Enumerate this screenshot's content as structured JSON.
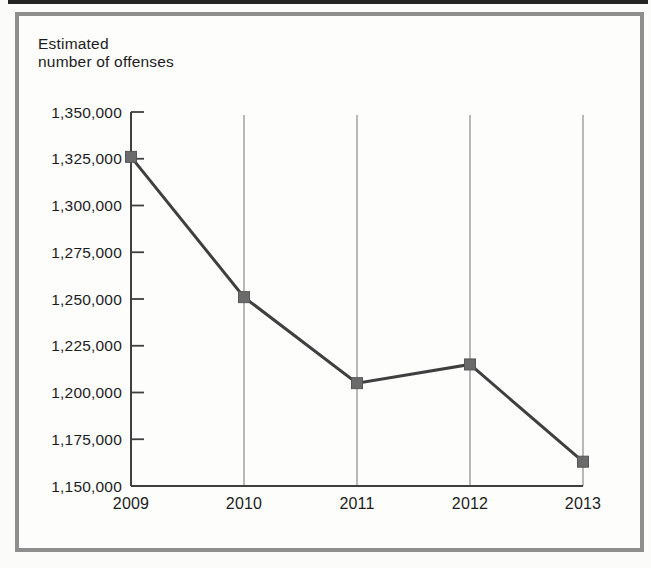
{
  "ylabel_display": {
    "line1": "Estimated",
    "line2": "number of offenses"
  },
  "colors": {
    "top_rule": "#242424",
    "frame_border": "#8e8e8e",
    "axis": "#3f3f3f",
    "gridline": "#8b8b8b",
    "line": "#3f3f3f",
    "marker": "#6b6b6b",
    "marker_edge": "#565656",
    "text": "#1c1c1c"
  },
  "chart_data": {
    "type": "line",
    "title": "",
    "ylabel": "Estimated number of offenses",
    "xlabel": "",
    "categories": [
      "2009",
      "2010",
      "2011",
      "2012",
      "2013"
    ],
    "series": [
      {
        "name": "Estimated number of offenses",
        "values": [
          1326000,
          1251000,
          1205000,
          1215000,
          1163000
        ]
      }
    ],
    "ylim": [
      1150000,
      1350000
    ],
    "ytick_step": 25000,
    "yticklabels": [
      "1,150,000",
      "1,175,000",
      "1,200,000",
      "1,225,000",
      "1,250,000",
      "1,275,000",
      "1,300,000",
      "1,325,000",
      "1,350,000"
    ],
    "grid": "vertical-x-gridlines-only",
    "legend": "none",
    "marker": "square"
  }
}
